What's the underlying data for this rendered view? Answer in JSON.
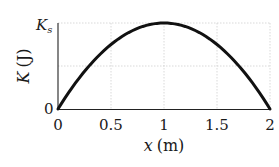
{
  "chart_data": {
    "type": "line",
    "title": "",
    "xlabel": "x (m)",
    "ylabel": "K (J)",
    "xlim": [
      0,
      2
    ],
    "ylim": [
      0,
      1
    ],
    "xticks": [
      "0",
      "0.5",
      "1",
      "1.5",
      "2"
    ],
    "yticks": [
      "0",
      "K_s"
    ],
    "grid": true,
    "series": [
      {
        "name": "K(x)",
        "description": "Parabolic kinetic energy, zero at x=0 and x=2, maximum K_s at x=1",
        "x": [
          0,
          0.25,
          0.5,
          0.75,
          1.0,
          1.25,
          1.5,
          1.75,
          2.0
        ],
        "y": [
          0,
          0.4375,
          0.75,
          0.9375,
          1.0,
          0.9375,
          0.75,
          0.4375,
          0
        ],
        "y_units": "fraction of K_s",
        "color": "#111111"
      }
    ]
  },
  "labels": {
    "x_axis": "x (m)",
    "x_axis_var": "x",
    "x_axis_unit": "(m)",
    "y_axis_var": "K",
    "y_axis_unit": "(J)",
    "y_top": "K",
    "y_top_sub": "s",
    "y_zero": "0",
    "x_ticks": [
      "0",
      "0.5",
      "1",
      "1.5",
      "2"
    ]
  },
  "colors": {
    "curve": "#111111",
    "axis": "#222222",
    "grid": "#cfcfcf"
  }
}
